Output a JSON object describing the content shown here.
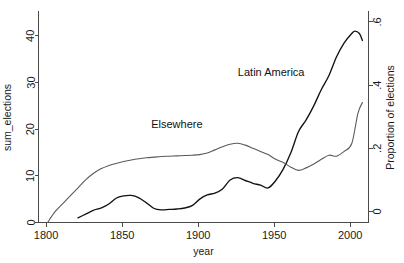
{
  "chart_data": {
    "type": "line",
    "title": "",
    "subtitle": "",
    "xlabel": "year",
    "ylabel": "sum_elections",
    "y2label": "Proportion of elections",
    "xlim": [
      1795,
      2012
    ],
    "ylim": [
      0,
      45
    ],
    "y2lim": [
      -0.035,
      0.63
    ],
    "grid": false,
    "legend_position": "inline-annotations",
    "xticks": [
      1800,
      1850,
      1900,
      1950,
      2000
    ],
    "xtick_labels": [
      "1800",
      "1850",
      "1900",
      "1950",
      "2000"
    ],
    "yticks": [
      0,
      10,
      20,
      30,
      40
    ],
    "ytick_labels": [
      "0",
      "10",
      "20",
      "30",
      "40"
    ],
    "y2ticks": [
      0,
      0.2,
      0.4,
      0.6
    ],
    "y2tick_labels": [
      "0",
      ".2",
      ".4",
      ".6"
    ],
    "annotations": [
      {
        "name": "latin-america-label",
        "text": "Latin America",
        "x": 1948,
        "y": 31.5
      },
      {
        "name": "elsewhere-label",
        "text": "Elsewhere",
        "x": 1886,
        "y": 20.2
      }
    ],
    "series": [
      {
        "name": "Latin America",
        "axis": "left",
        "color": "#121212",
        "x": [
          1821,
          1826,
          1831,
          1836,
          1841,
          1846,
          1851,
          1856,
          1861,
          1866,
          1871,
          1876,
          1881,
          1886,
          1891,
          1896,
          1901,
          1906,
          1911,
          1916,
          1921,
          1926,
          1931,
          1936,
          1941,
          1946,
          1951,
          1956,
          1961,
          1966,
          1971,
          1976,
          1981,
          1986,
          1991,
          1996,
          2001,
          2003,
          2006,
          2008
        ],
        "values": [
          1.0,
          1.8,
          2.6,
          3.1,
          3.9,
          5.2,
          5.7,
          5.8,
          5.3,
          4.2,
          3.0,
          2.7,
          2.8,
          2.9,
          3.1,
          3.6,
          5.0,
          5.9,
          6.3,
          7.2,
          9.1,
          9.6,
          9.0,
          8.4,
          8.0,
          7.4,
          9.0,
          11.5,
          15.0,
          19.5,
          22.0,
          25.0,
          28.5,
          31.5,
          35.5,
          38.5,
          40.5,
          41.0,
          40.5,
          39.0
        ]
      },
      {
        "name": "Elsewhere",
        "axis": "right",
        "color": "#5a5a5a",
        "x": [
          1801,
          1806,
          1811,
          1816,
          1821,
          1826,
          1831,
          1836,
          1841,
          1846,
          1851,
          1856,
          1861,
          1866,
          1871,
          1876,
          1881,
          1886,
          1891,
          1896,
          1901,
          1906,
          1911,
          1916,
          1921,
          1926,
          1931,
          1936,
          1941,
          1946,
          1951,
          1956,
          1961,
          1966,
          1971,
          1976,
          1981,
          1986,
          1991,
          1996,
          2001,
          2005,
          2008
        ],
        "values": [
          -0.035,
          0.0,
          0.025,
          0.05,
          0.075,
          0.1,
          0.12,
          0.135,
          0.145,
          0.152,
          0.158,
          0.163,
          0.167,
          0.17,
          0.172,
          0.174,
          0.175,
          0.176,
          0.177,
          0.178,
          0.18,
          0.185,
          0.195,
          0.205,
          0.213,
          0.216,
          0.21,
          0.2,
          0.19,
          0.18,
          0.165,
          0.155,
          0.14,
          0.13,
          0.138,
          0.15,
          0.165,
          0.178,
          0.175,
          0.19,
          0.215,
          0.31,
          0.345
        ]
      }
    ]
  }
}
